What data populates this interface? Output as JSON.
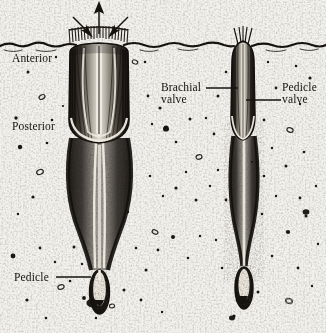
{
  "figure": {
    "kind": "scientific-illustration",
    "background_color": "#f2f1ed",
    "ink_color": "#16130f",
    "width": 326,
    "height": 333
  },
  "labels": {
    "anterior": "Anterior",
    "posterior": "Posterior",
    "brachial_valve_line1": "Brachial",
    "brachial_valve_line2": "valve",
    "pedicle_valve_line1": "Pedicle",
    "pedicle_valve_line2": "valve",
    "pedicle": "Pedicle"
  },
  "annotations": {
    "arrows": [
      {
        "name": "water-outflow-arrow",
        "direction": "up",
        "x": 99,
        "y_from": 34,
        "y_to": 5
      },
      {
        "name": "water-inflow-arrow-left",
        "direction": "down-right",
        "x_from": 74,
        "y_from": 18,
        "x_to": 90,
        "y_to": 34
      },
      {
        "name": "water-inflow-arrow-right",
        "direction": "down-left",
        "x_from": 127,
        "y_from": 18,
        "x_to": 111,
        "y_to": 34
      }
    ],
    "leader_lines": [
      {
        "name": "brachial-valve-leader",
        "x1": 206,
        "y1": 88,
        "x2": 238,
        "y2": 88
      },
      {
        "name": "pedicle-valve-leader",
        "x1": 280,
        "y1": 100,
        "x2": 246,
        "y2": 100
      },
      {
        "name": "pedicle-leader",
        "x1": 56,
        "y1": 277,
        "x2": 90,
        "y2": 277
      }
    ]
  },
  "label_positions": {
    "anterior": {
      "x": 12,
      "y": 58
    },
    "posterior": {
      "x": 12,
      "y": 126
    },
    "brachial_valve": {
      "x": 162,
      "y": 82
    },
    "pedicle_valve": {
      "x": 282,
      "y": 82
    },
    "pedicle": {
      "x": 14,
      "y": 271
    }
  },
  "specimens": [
    {
      "name": "anterior-view-specimen",
      "x_center": 99,
      "shell_top": 42,
      "shell_bottom": 142,
      "shell_width": 62,
      "burrow_bottom": 268,
      "pedicle_bulb_y": 292,
      "has_setae_fringe": true
    },
    {
      "name": "lateral-view-specimen",
      "x_center": 243,
      "shell_top": 40,
      "shell_bottom": 140,
      "shell_width": 24,
      "burrow_bottom": 266,
      "pedicle_bulb_y": 288,
      "has_setae_fringe": false
    }
  ],
  "sediment": {
    "surface_line_y": 44,
    "name": "sediment-surface-line"
  }
}
